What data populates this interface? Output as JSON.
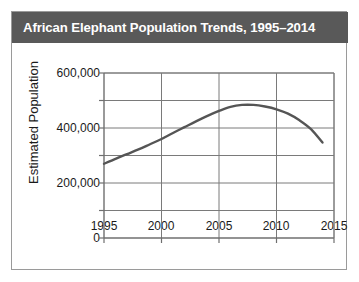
{
  "chart_data": {
    "type": "line",
    "title": "African Elephant Population Trends, 1995–2014",
    "xlabel": "Year",
    "ylabel": "Estimated Population",
    "xlim": [
      1995,
      2015
    ],
    "ylim": [
      0,
      600000
    ],
    "grid": true,
    "legend": null,
    "x_ticks": [
      "1995",
      "2000",
      "2005",
      "2010",
      "2015"
    ],
    "x_tick_values": [
      1995,
      2000,
      2005,
      2010,
      2015
    ],
    "y_ticks": [
      "0",
      "200,000",
      "400,000",
      "600,000"
    ],
    "y_tick_values": [
      0,
      200000,
      400000,
      600000
    ],
    "y_minor_ticks": [
      100000,
      300000,
      500000
    ],
    "series": [
      {
        "name": "Estimated Population",
        "color": "#555555",
        "x": [
          1995,
          1996,
          1997,
          1998,
          1999,
          2000,
          2001,
          2002,
          2003,
          2004,
          2005,
          2006,
          2007,
          2008,
          2009,
          2010,
          2011,
          2012,
          2013,
          2014
        ],
        "values": [
          270000,
          288000,
          305000,
          322000,
          341000,
          360000,
          382000,
          403000,
          424000,
          444000,
          462000,
          477000,
          484000,
          484000,
          478000,
          468000,
          452000,
          428000,
          396000,
          347000
        ]
      }
    ]
  },
  "figure": {
    "title": "African Elephant Population Trends, 1995–2014",
    "title_bar_color": "#595959",
    "border_color": "#9a9a9a",
    "background_color": "#ffffff",
    "axis_color": "#6f6f6f",
    "grid_color": "#7a7a7a",
    "line_color": "#555555"
  }
}
